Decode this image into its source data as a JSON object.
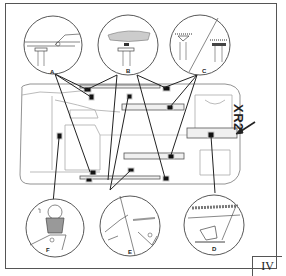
{
  "diagram": {
    "model_label": "XR2",
    "page_number": "IV",
    "detail_labels": [
      "A",
      "B",
      "C",
      "D",
      "E",
      "F"
    ],
    "colors": {
      "line": "#222222",
      "faint_line": "#9a9a9a",
      "marker": "#111111",
      "background": "#ffffff"
    },
    "insets": [
      {
        "label": "A",
        "description": "sill flange with support pad"
      },
      {
        "label": "B",
        "description": "support pad under hatched body section"
      },
      {
        "label": "C",
        "description": "split view of two support pad variants"
      },
      {
        "label": "D",
        "description": "rear jacking point on body"
      },
      {
        "label": "E",
        "description": "split view of jack contact areas"
      },
      {
        "label": "F",
        "description": "jack head under body point"
      }
    ]
  }
}
